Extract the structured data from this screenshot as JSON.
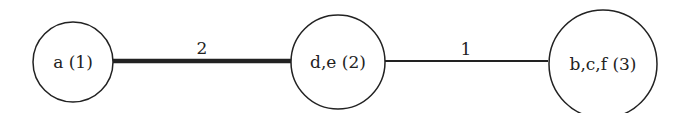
{
  "diagram": {
    "nodes": [
      {
        "id": "n1",
        "label": "a (1)",
        "cx": 73,
        "cy": 62,
        "r": 40
      },
      {
        "id": "n2",
        "label": "d,e (2)",
        "cx": 338,
        "cy": 62,
        "r": 47
      },
      {
        "id": "n3",
        "label": "b,c,f (3)",
        "cx": 603,
        "cy": 63,
        "r": 55
      }
    ],
    "edges": [
      {
        "from": "n1",
        "to": "n2",
        "weight": "2",
        "stroke_width": 4.5
      },
      {
        "from": "n2",
        "to": "n3",
        "weight": "1",
        "stroke_width": 2
      }
    ],
    "colors": {
      "stroke": "#222222",
      "background": "#ffffff"
    }
  }
}
